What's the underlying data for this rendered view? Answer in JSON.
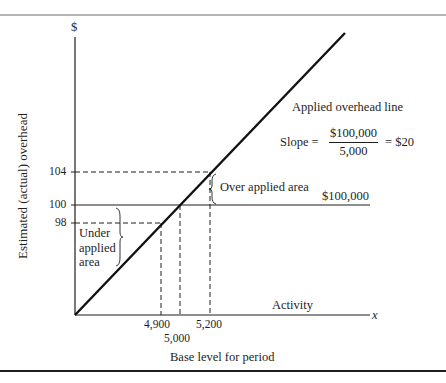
{
  "figure": {
    "y_axis_symbol": "$",
    "x_axis_symbol": "x",
    "y_axis_label": "Estimated (actual) overhead",
    "x_axis_label": "Base level for period",
    "x_axis_inline_label": "Activity",
    "y_ticks": [
      {
        "label": "104",
        "value": 104
      },
      {
        "label": "100",
        "value": 100
      },
      {
        "label": "98",
        "value": 98
      }
    ],
    "x_ticks": [
      {
        "label": "4,900",
        "value": 4900
      },
      {
        "label": "5,000",
        "value": 5000
      },
      {
        "label": "5,200",
        "value": 5200
      }
    ],
    "line_label": "Applied overhead line",
    "slope": {
      "prefix": "Slope =",
      "numerator": "$100,000",
      "denominator": "5,000",
      "result": "= $20"
    },
    "budget_line_label": "$100,000",
    "over_applied_label": "Over applied area",
    "under_applied_label": [
      "Under",
      "applied",
      "area"
    ]
  },
  "colors": {
    "ink": "#1e1e1e",
    "rule": "#555555",
    "background": "#ffffff"
  }
}
